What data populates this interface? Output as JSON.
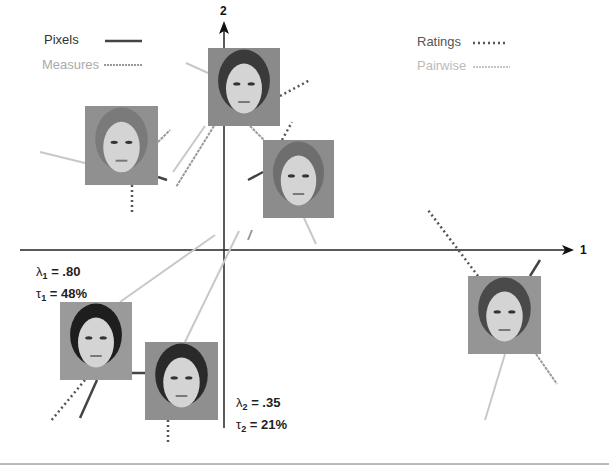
{
  "legend": {
    "left": [
      {
        "label": "Pixels",
        "style": "solid",
        "color": "#444444"
      },
      {
        "label": "Measures",
        "style": "dashed",
        "color": "#999999"
      }
    ],
    "right": [
      {
        "label": "Ratings",
        "style": "dotted",
        "color": "#555555"
      },
      {
        "label": "Pairwise",
        "style": "dashed",
        "color": "#bbbbbb"
      }
    ]
  },
  "axes": {
    "x_label": "1",
    "y_label": "2"
  },
  "stats": {
    "dim1": {
      "lambda_sym": "λ",
      "lambda_sub": "1",
      "lambda_val": " = .80",
      "tau_sym": "τ",
      "tau_sub": "1",
      "tau_val": " = 48%"
    },
    "dim2": {
      "lambda_sym": "λ",
      "lambda_sub": "2",
      "lambda_val": " = .35",
      "tau_sym": "τ",
      "tau_sub": "2",
      "tau_val": " = 21%"
    }
  },
  "faces": [
    {
      "id": "face-short-hair-man",
      "x": 208,
      "y": 48,
      "w": 72,
      "h": 78,
      "tone": "#8a8a8a",
      "hair": "#3a3a3a"
    },
    {
      "id": "face-blonde-woman",
      "x": 85,
      "y": 106,
      "w": 73,
      "h": 79,
      "tone": "#909090",
      "hair": "#7a7a7a"
    },
    {
      "id": "face-long-hair-man",
      "x": 263,
      "y": 140,
      "w": 71,
      "h": 78,
      "tone": "#8c8c8c",
      "hair": "#6e6e6e"
    },
    {
      "id": "face-bearded-man",
      "x": 468,
      "y": 276,
      "w": 73,
      "h": 78,
      "tone": "#959595",
      "hair": "#4a4a4a"
    },
    {
      "id": "face-dark-hair-woman",
      "x": 60,
      "y": 302,
      "w": 72,
      "h": 78,
      "tone": "#9a9a9a",
      "hair": "#1e1e1e"
    },
    {
      "id": "face-short-hair-woman",
      "x": 145,
      "y": 342,
      "w": 73,
      "h": 78,
      "tone": "#8f8f8f",
      "hair": "#2a2a2a"
    }
  ],
  "colors": {
    "axis": "#222222",
    "pixels": "#444444",
    "measures": "#999999",
    "ratings": "#555555",
    "pairwise": "#c4c4c4"
  }
}
